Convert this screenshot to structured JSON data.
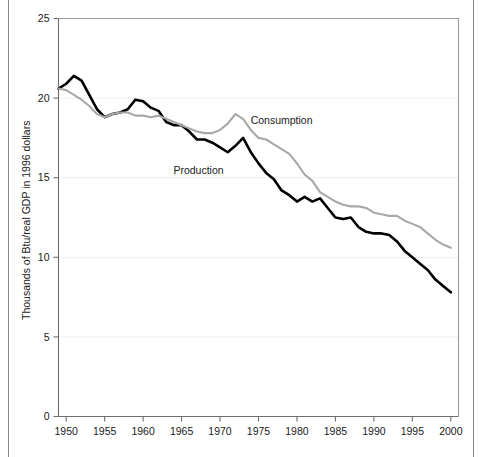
{
  "chart_data": {
    "type": "line",
    "title": "",
    "xlabel": "",
    "ylabel": "Thousands of Btu/real GDP in 1996 dollars",
    "xlim": [
      1949,
      2001
    ],
    "ylim": [
      0,
      25
    ],
    "xticks": [
      1950,
      1955,
      1960,
      1965,
      1970,
      1975,
      1980,
      1985,
      1990,
      1995,
      2000
    ],
    "yticks": [
      0,
      5,
      10,
      15,
      20,
      25
    ],
    "grid": "horizontal-faint",
    "legend_position": "inline-annotation",
    "x": [
      1949,
      1950,
      1951,
      1952,
      1953,
      1954,
      1955,
      1956,
      1957,
      1958,
      1959,
      1960,
      1961,
      1962,
      1963,
      1964,
      1965,
      1966,
      1967,
      1968,
      1969,
      1970,
      1971,
      1972,
      1973,
      1974,
      1975,
      1976,
      1977,
      1978,
      1979,
      1980,
      1981,
      1982,
      1983,
      1984,
      1985,
      1986,
      1987,
      1988,
      1989,
      1990,
      1991,
      1992,
      1993,
      1994,
      1995,
      1996,
      1997,
      1998,
      1999,
      2000
    ],
    "series": [
      {
        "name": "Production",
        "color": "#000000",
        "label": "Production",
        "label_x": 1967.2,
        "label_y": 15.25,
        "values": [
          20.6,
          20.9,
          21.4,
          21.1,
          20.2,
          19.3,
          18.8,
          19.0,
          19.1,
          19.3,
          19.9,
          19.8,
          19.4,
          19.2,
          18.5,
          18.3,
          18.3,
          17.9,
          17.4,
          17.4,
          17.2,
          16.9,
          16.6,
          17.0,
          17.5,
          16.6,
          15.9,
          15.3,
          14.9,
          14.2,
          13.9,
          13.5,
          13.8,
          13.5,
          13.7,
          13.1,
          12.5,
          12.4,
          12.5,
          11.9,
          11.6,
          11.5,
          11.5,
          11.4,
          11.0,
          10.4,
          10.0,
          9.6,
          9.2,
          8.6,
          8.2,
          7.8
        ]
      },
      {
        "name": "Consumption",
        "color": "#a8a8a8",
        "label": "Consumption",
        "label_x": 1978.0,
        "label_y": 18.35,
        "values": [
          20.6,
          20.5,
          20.2,
          19.9,
          19.5,
          19.0,
          18.8,
          19.0,
          19.1,
          19.1,
          18.9,
          18.9,
          18.8,
          18.9,
          18.7,
          18.5,
          18.3,
          18.1,
          17.9,
          17.8,
          17.8,
          18.0,
          18.4,
          19.0,
          18.7,
          18.0,
          17.5,
          17.4,
          17.1,
          16.8,
          16.5,
          15.9,
          15.2,
          14.8,
          14.1,
          13.8,
          13.5,
          13.3,
          13.2,
          13.2,
          13.1,
          12.8,
          12.7,
          12.6,
          12.6,
          12.3,
          12.1,
          11.9,
          11.5,
          11.1,
          10.8,
          10.6
        ]
      }
    ]
  },
  "axis": {
    "y_tick_labels": [
      "0",
      "5",
      "10",
      "15",
      "20",
      "25"
    ],
    "x_tick_labels": [
      "1950",
      "1955",
      "1960",
      "1965",
      "1970",
      "1975",
      "1980",
      "1985",
      "1990",
      "1995",
      "2000"
    ],
    "y_title": "Thousands of Btu/real GDP in 1996 dollars"
  }
}
